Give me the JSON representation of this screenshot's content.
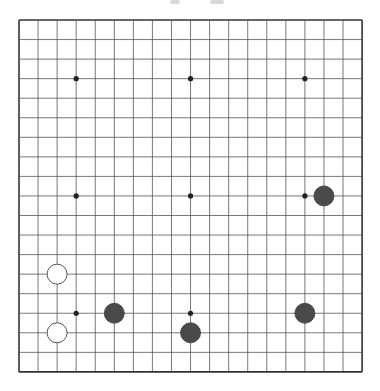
{
  "board": {
    "size": 19,
    "origin_x": 19,
    "origin_y": 20,
    "spacing_x": 19.06,
    "spacing_y": 19.55,
    "line_color": "#555555",
    "edge_color": "#333333",
    "background": "#ffffff",
    "star_points": [
      [
        3,
        3
      ],
      [
        9,
        3
      ],
      [
        15,
        3
      ],
      [
        3,
        9
      ],
      [
        9,
        9
      ],
      [
        15,
        9
      ],
      [
        3,
        15
      ],
      [
        9,
        15
      ],
      [
        15,
        15
      ]
    ],
    "stone_radius": 10
  },
  "stones": [
    {
      "color": "white",
      "col": 2,
      "row": 13
    },
    {
      "color": "white",
      "col": 2,
      "row": 16
    },
    {
      "color": "black",
      "col": 5,
      "row": 15
    },
    {
      "color": "black",
      "col": 9,
      "row": 16
    },
    {
      "color": "black",
      "col": 15,
      "row": 15
    },
    {
      "color": "black",
      "col": 16,
      "row": 9
    }
  ],
  "colors": {
    "black_stone": "#4a4a4a",
    "black_stone_edge": "#3a3a3a",
    "white_stone": "#ffffff",
    "white_stone_edge": "#555555",
    "star_point": "#222222"
  }
}
